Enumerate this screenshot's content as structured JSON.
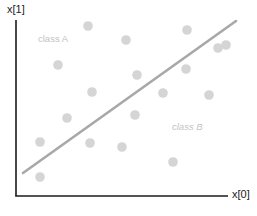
{
  "figure": {
    "width": 257,
    "height": 216,
    "background": "#ffffff"
  },
  "axes": {
    "y_label": "x[1]",
    "x_label": "x[0]",
    "color": "#1a1a1a",
    "origin_x": 16,
    "origin_y": 196,
    "y_top": 20,
    "x_right": 228
  },
  "annotations": {
    "class_a": "class A",
    "class_b": "class B",
    "color": "#c2c2c2"
  },
  "chart_data": {
    "type": "scatter",
    "title": "",
    "xlabel": "x[0]",
    "ylabel": "x[1]",
    "grid": false,
    "legend": false,
    "axis_style": "L-shaped spines, no ticks, no tick labels",
    "point_color": "#d5d5d5",
    "point_radius": 4.8,
    "xlim": [
      16,
      257
    ],
    "ylim": [
      0,
      196
    ],
    "annotations": [
      {
        "text": "class A",
        "x": 38,
        "y": 40,
        "color": "#c2c2c2",
        "style": "normal"
      },
      {
        "text": "class B",
        "x": 172,
        "y": 128,
        "color": "#c2c2c2",
        "style": "italic"
      }
    ],
    "decision_boundary": {
      "type": "line",
      "color": "#a8a8a8",
      "width": 2.6,
      "x1": 23,
      "y1": 173,
      "x2": 236,
      "y2": 21
    },
    "points": [
      {
        "x": 88,
        "y": 26
      },
      {
        "x": 126,
        "y": 40
      },
      {
        "x": 187,
        "y": 30
      },
      {
        "x": 58,
        "y": 65
      },
      {
        "x": 186,
        "y": 69
      },
      {
        "x": 218,
        "y": 48
      },
      {
        "x": 226,
        "y": 45
      },
      {
        "x": 137,
        "y": 75
      },
      {
        "x": 92,
        "y": 92
      },
      {
        "x": 163,
        "y": 93
      },
      {
        "x": 209,
        "y": 95
      },
      {
        "x": 67,
        "y": 118
      },
      {
        "x": 135,
        "y": 115
      },
      {
        "x": 40,
        "y": 142
      },
      {
        "x": 90,
        "y": 143
      },
      {
        "x": 122,
        "y": 147
      },
      {
        "x": 173,
        "y": 162
      },
      {
        "x": 40,
        "y": 177
      }
    ]
  }
}
